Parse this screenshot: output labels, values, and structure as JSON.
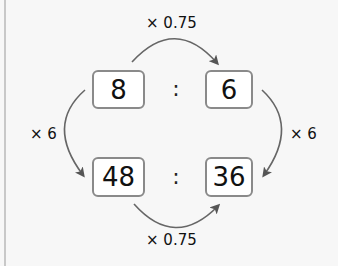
{
  "diagram": {
    "type": "equivalent-ratio-diagram",
    "top_ratio": {
      "left": "8",
      "separator": ":",
      "right": "6"
    },
    "bottom_ratio": {
      "left": "48",
      "separator": ":",
      "right": "36"
    },
    "arrows": {
      "top": {
        "label": "× 0.75",
        "from": "8",
        "to": "6"
      },
      "bottom": {
        "label": "× 0.75",
        "from": "48",
        "to": "36"
      },
      "left": {
        "label": "× 6",
        "from": "8",
        "to": "48"
      },
      "right": {
        "label": "× 6",
        "from": "6",
        "to": "36"
      }
    },
    "colors": {
      "arrow": "#555555",
      "box_border": "#8a8a8a",
      "background": "#f7f7f7"
    }
  }
}
